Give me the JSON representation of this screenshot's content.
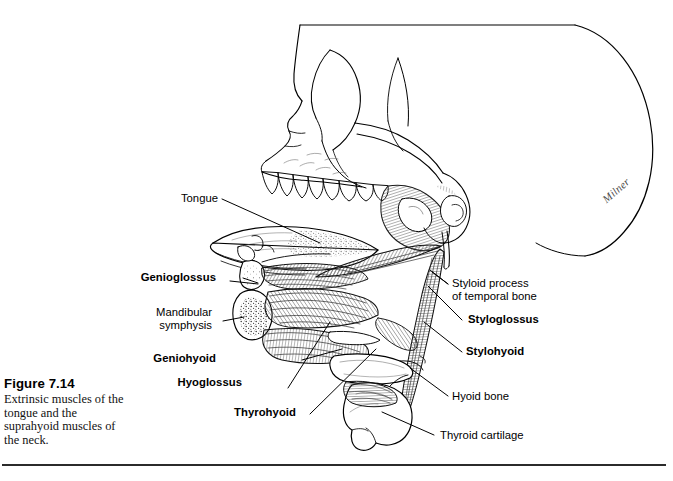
{
  "figure": {
    "number": "Figure 7.14",
    "caption": "Extrinsic muscles of the tongue and the suprahyoid muscles of the neck."
  },
  "artist_signature": "Milner",
  "colors": {
    "ink": "#000000",
    "background": "#ffffff",
    "rule": "#2b2b2b",
    "shading": "#6d6d6d"
  },
  "labels": {
    "left": [
      {
        "id": "tongue",
        "text": "Tongue",
        "bold": false
      },
      {
        "id": "genioglossus",
        "text": "Genioglossus",
        "bold": true
      },
      {
        "id": "mandibular-symphysis",
        "text": "Mandibular\nsymphysis",
        "bold": false
      },
      {
        "id": "geniohyoid",
        "text": "Geniohyoid",
        "bold": true
      },
      {
        "id": "hyoglossus",
        "text": "Hyoglossus",
        "bold": true
      },
      {
        "id": "thyrohyoid",
        "text": "Thyrohyoid",
        "bold": true
      }
    ],
    "right": [
      {
        "id": "styloid-process",
        "text": "Styloid process\nof temporal bone",
        "bold": false
      },
      {
        "id": "styloglossus",
        "text": "Styloglossus",
        "bold": true
      },
      {
        "id": "stylohyoid",
        "text": "Stylohyoid",
        "bold": true
      },
      {
        "id": "hyoid-bone",
        "text": "Hyoid bone",
        "bold": false
      },
      {
        "id": "thyroid-cartilage",
        "text": "Thyroid cartilage",
        "bold": false
      }
    ]
  },
  "illustration": {
    "type": "anatomical-line-drawing",
    "view": "lateral (left side) view of skull, mandible, tongue and anterior neck",
    "structures": [
      "cranial vault",
      "frontal bone",
      "nasal bone",
      "orbital rim",
      "zygomatic arch",
      "maxilla with upper teeth",
      "mandible (cut at symphysis)",
      "mandibular ramus and condyle",
      "styloid process",
      "mastoid process",
      "tongue body",
      "genioglossus",
      "hyoglossus",
      "styloglossus",
      "geniohyoid",
      "stylohyoid",
      "thyrohyoid",
      "hyoid bone",
      "thyroid cartilage"
    ]
  }
}
